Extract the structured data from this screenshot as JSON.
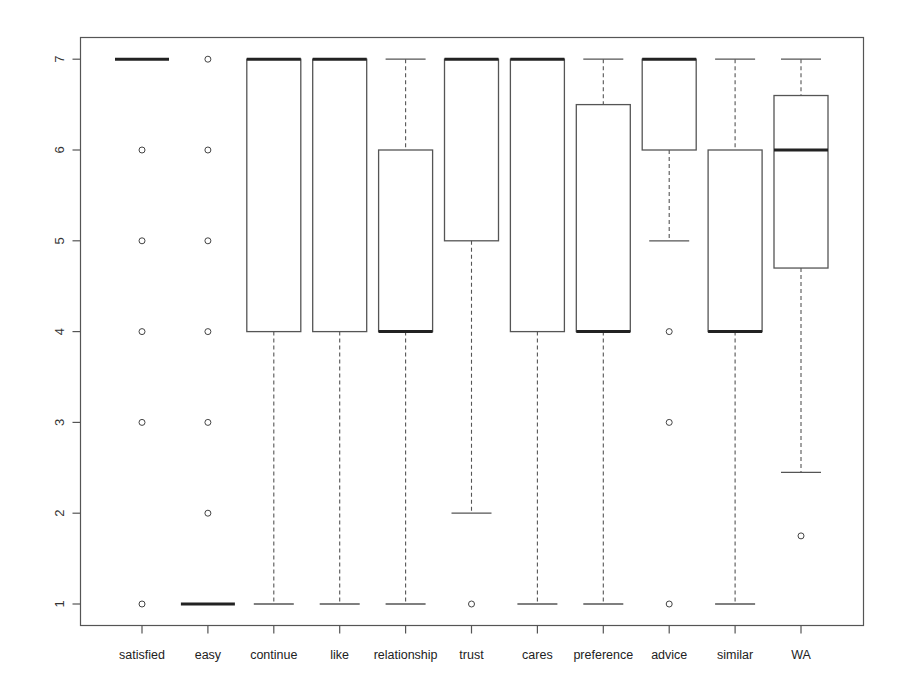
{
  "chart_data": {
    "type": "boxplot",
    "title": "",
    "xlabel": "",
    "ylabel": "",
    "ylim": [
      0.65,
      7.25
    ],
    "yticks": [
      1,
      2,
      3,
      4,
      5,
      6,
      7
    ],
    "grid": false,
    "legend": null,
    "categories": [
      "satisfied",
      "easy",
      "continue",
      "like",
      "relationship",
      "trust",
      "cares",
      "preference",
      "advice",
      "similar",
      "WA"
    ],
    "series": [
      {
        "name": "satisfied",
        "whisker_low": 7,
        "q1": 7,
        "median": 7,
        "q3": 7,
        "whisker_high": 7,
        "outliers": [
          6,
          5,
          4,
          3,
          1
        ]
      },
      {
        "name": "easy",
        "whisker_low": 1,
        "q1": 1,
        "median": 1,
        "q3": 1,
        "whisker_high": 1,
        "outliers": [
          7,
          6,
          5,
          4,
          3,
          2
        ]
      },
      {
        "name": "continue",
        "whisker_low": 1,
        "q1": 4,
        "median": 7,
        "q3": 7,
        "whisker_high": 7,
        "outliers": []
      },
      {
        "name": "like",
        "whisker_low": 1,
        "q1": 4,
        "median": 7,
        "q3": 7,
        "whisker_high": 7,
        "outliers": []
      },
      {
        "name": "relationship",
        "whisker_low": 1,
        "q1": 4,
        "median": 4,
        "q3": 6,
        "whisker_high": 7,
        "outliers": []
      },
      {
        "name": "trust",
        "whisker_low": 2,
        "q1": 5,
        "median": 7,
        "q3": 7,
        "whisker_high": 7,
        "outliers": [
          1
        ]
      },
      {
        "name": "cares",
        "whisker_low": 1,
        "q1": 4,
        "median": 7,
        "q3": 7,
        "whisker_high": 7,
        "outliers": []
      },
      {
        "name": "preference",
        "whisker_low": 1,
        "q1": 4,
        "median": 4,
        "q3": 6.5,
        "whisker_high": 7,
        "outliers": []
      },
      {
        "name": "advice",
        "whisker_low": 5,
        "q1": 6,
        "median": 7,
        "q3": 7,
        "whisker_high": 7,
        "outliers": [
          4,
          3,
          1
        ]
      },
      {
        "name": "similar",
        "whisker_low": 1,
        "q1": 4,
        "median": 4,
        "q3": 6,
        "whisker_high": 7,
        "outliers": []
      },
      {
        "name": "WA",
        "whisker_low": 2.45,
        "q1": 4.7,
        "median": 6,
        "q3": 6.6,
        "whisker_high": 7,
        "outliers": [
          1.75
        ]
      }
    ]
  },
  "colors": {
    "background": "#ffffff",
    "frame": "#555555",
    "box": "#555555",
    "median": "#222222",
    "whisker": "#555555"
  }
}
